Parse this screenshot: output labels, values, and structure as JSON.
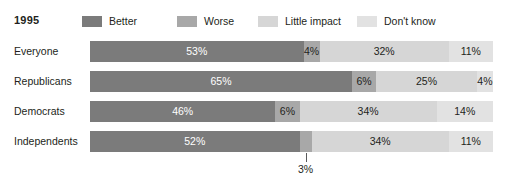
{
  "header": {
    "title": "1995"
  },
  "colors": {
    "better": "#7b7b7b",
    "worse": "#a8a8a8",
    "little_impact": "#d6d6d6",
    "dont_know": "#e2e2e2",
    "text": "#231f20",
    "background": "#ffffff",
    "callout_line": "#58595b"
  },
  "chart_data": {
    "type": "bar",
    "title": "1995",
    "orientation": "horizontal",
    "stacked": true,
    "normalized": true,
    "xlabel": "",
    "ylabel": "",
    "xlim": [
      0,
      100
    ],
    "grid": false,
    "legend_position": "top",
    "unit": "%",
    "categories": [
      "Everyone",
      "Republicans",
      "Democrats",
      "Independents"
    ],
    "series": [
      {
        "name": "Better",
        "color": "#7b7b7b",
        "values": [
          53,
          65,
          46,
          52
        ]
      },
      {
        "name": "Worse",
        "color": "#a8a8a8",
        "values": [
          4,
          6,
          6,
          3
        ]
      },
      {
        "name": "Little impact",
        "color": "#d6d6d6",
        "values": [
          32,
          25,
          34,
          34
        ]
      },
      {
        "name": "Don't know",
        "color": "#e2e2e2",
        "values": [
          11,
          4,
          14,
          11
        ]
      }
    ],
    "annotations": [
      {
        "row": "Independents",
        "series": "Worse",
        "text": "3%",
        "placement": "below-with-leader-line"
      }
    ]
  },
  "legend": {
    "items": [
      {
        "label": "Better",
        "color": "#7b7b7b"
      },
      {
        "label": "Worse",
        "color": "#a8a8a8"
      },
      {
        "label": "Little impact",
        "color": "#d6d6d6"
      },
      {
        "label": "Don't know",
        "color": "#e2e2e2"
      }
    ]
  },
  "rows": [
    {
      "label": "Everyone",
      "segments": [
        {
          "series": "Better",
          "value": 53,
          "text": "53%",
          "color": "#7b7b7b",
          "label_on_dark": true,
          "label_inline": true
        },
        {
          "series": "Worse",
          "value": 4,
          "text": "4%",
          "color": "#a8a8a8",
          "label_on_dark": false,
          "label_inline": true
        },
        {
          "series": "Little impact",
          "value": 32,
          "text": "32%",
          "color": "#d6d6d6",
          "label_on_dark": false,
          "label_inline": true
        },
        {
          "series": "Don't know",
          "value": 11,
          "text": "11%",
          "color": "#e2e2e2",
          "label_on_dark": false,
          "label_inline": true
        }
      ]
    },
    {
      "label": "Republicans",
      "segments": [
        {
          "series": "Better",
          "value": 65,
          "text": "65%",
          "color": "#7b7b7b",
          "label_on_dark": true,
          "label_inline": true
        },
        {
          "series": "Worse",
          "value": 6,
          "text": "6%",
          "color": "#a8a8a8",
          "label_on_dark": false,
          "label_inline": true
        },
        {
          "series": "Little impact",
          "value": 25,
          "text": "25%",
          "color": "#d6d6d6",
          "label_on_dark": false,
          "label_inline": true
        },
        {
          "series": "Don't know",
          "value": 4,
          "text": "4%",
          "color": "#e2e2e2",
          "label_on_dark": false,
          "label_inline": true
        }
      ]
    },
    {
      "label": "Democrats",
      "segments": [
        {
          "series": "Better",
          "value": 46,
          "text": "46%",
          "color": "#7b7b7b",
          "label_on_dark": true,
          "label_inline": true
        },
        {
          "series": "Worse",
          "value": 6,
          "text": "6%",
          "color": "#a8a8a8",
          "label_on_dark": false,
          "label_inline": true
        },
        {
          "series": "Little impact",
          "value": 34,
          "text": "34%",
          "color": "#d6d6d6",
          "label_on_dark": false,
          "label_inline": true
        },
        {
          "series": "Don't know",
          "value": 14,
          "text": "14%",
          "color": "#e2e2e2",
          "label_on_dark": false,
          "label_inline": true
        }
      ]
    },
    {
      "label": "Independents",
      "segments": [
        {
          "series": "Better",
          "value": 52,
          "text": "52%",
          "color": "#7b7b7b",
          "label_on_dark": true,
          "label_inline": true
        },
        {
          "series": "Worse",
          "value": 3,
          "text": "3%",
          "color": "#a8a8a8",
          "label_on_dark": false,
          "label_inline": false,
          "callout": true
        },
        {
          "series": "Little impact",
          "value": 34,
          "text": "34%",
          "color": "#d6d6d6",
          "label_on_dark": false,
          "label_inline": true
        },
        {
          "series": "Don't know",
          "value": 11,
          "text": "11%",
          "color": "#e2e2e2",
          "label_on_dark": false,
          "label_inline": true
        }
      ]
    }
  ]
}
